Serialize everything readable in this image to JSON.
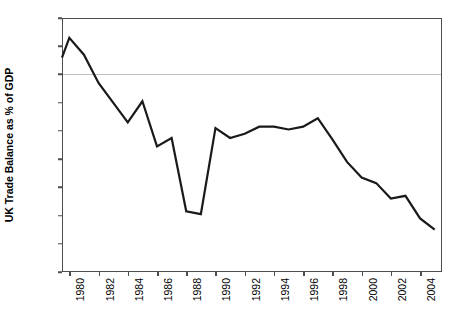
{
  "chart_data": {
    "type": "line",
    "title": "",
    "xlabel": "",
    "ylabel": "UK Trade Balance as % of GDP",
    "ylim": [
      -7,
      2
    ],
    "xlim": [
      1979.5,
      2005.5
    ],
    "grid": false,
    "legend": false,
    "zero_line": true,
    "y_tick_labels": [
      "2%",
      "1%",
      "0%",
      "-1%",
      "-2%",
      "-3%",
      "-4%",
      "-5%",
      "-6%",
      "-7%"
    ],
    "y_tick_values": [
      2,
      1,
      0,
      -1,
      -2,
      -3,
      -4,
      -5,
      -6,
      -7
    ],
    "x_tick_labels": [
      "1980",
      "1982",
      "1984",
      "1986",
      "1988",
      "1990",
      "1992",
      "1994",
      "1996",
      "1998",
      "2000",
      "2002",
      "2004"
    ],
    "x_tick_values": [
      1980,
      1982,
      1984,
      1986,
      1988,
      1990,
      1992,
      1994,
      1996,
      1998,
      2000,
      2002,
      2004
    ],
    "series": [
      {
        "name": "UK Trade Balance as % of GDP",
        "color": "#1a1a1a",
        "x": [
          1979.5,
          1980,
          1981,
          1982,
          1983,
          1984,
          1985,
          1986,
          1987,
          1988,
          1989,
          1990,
          1991,
          1992,
          1993,
          1994,
          1995,
          1996,
          1997,
          1998,
          1999,
          2000,
          2001,
          2002,
          2003,
          2004,
          2005
        ],
        "values": [
          0.6,
          1.3,
          0.7,
          -0.3,
          -1.0,
          -1.7,
          -0.95,
          -2.55,
          -2.25,
          -4.85,
          -4.95,
          -1.9,
          -2.25,
          -2.1,
          -1.85,
          -1.85,
          -1.95,
          -1.85,
          -1.55,
          -2.3,
          -3.1,
          -3.65,
          -3.85,
          -4.4,
          -4.3,
          -5.1,
          -5.5
        ]
      }
    ]
  }
}
